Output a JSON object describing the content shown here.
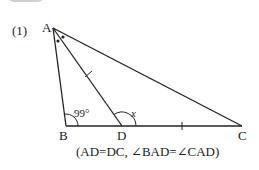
{
  "problem": {
    "number": "(1)"
  },
  "points": {
    "A": {
      "label": "A",
      "x": 53,
      "y": 28
    },
    "B": {
      "label": "B",
      "x": 66,
      "y": 126
    },
    "D": {
      "label": "D",
      "x": 122,
      "y": 126
    },
    "C": {
      "label": "C",
      "x": 242,
      "y": 126
    }
  },
  "angles": {
    "ABD": "99°",
    "ADC": "x"
  },
  "caption": "(AD=DC, ∠BAD=∠CAD)",
  "colors": {
    "line": "#222222",
    "header_tab": "#cfcfcf"
  }
}
